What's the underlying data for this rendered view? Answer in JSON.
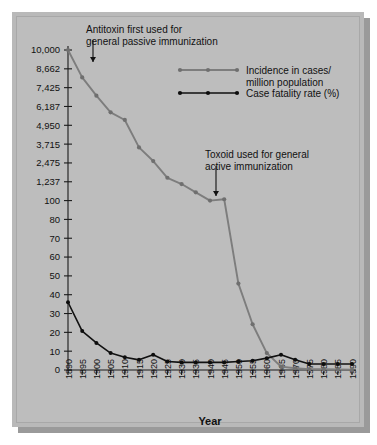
{
  "figure": {
    "background_color": "#ffffff",
    "panel_color": "#b9b9b9",
    "shadow_color": "#9a9a9a"
  },
  "colors": {
    "incidence": "#7d7d7d",
    "fatality": "#111111",
    "axis": "#1a1a1a",
    "text": "#111111"
  },
  "annotations": [
    {
      "name": "antitoxin-annotation",
      "line1": "Antitoxin first used for",
      "line2": "general passive immunization",
      "target_year": 1895
    },
    {
      "name": "toxoid-annotation",
      "line1": "Toxoid used for general",
      "line2": "active immunization",
      "target_year": 1940
    }
  ],
  "legend": {
    "position": "top-right",
    "entries": [
      {
        "name": "legend-incidence",
        "label_line1": "Incidence in cases/",
        "label_line2": "million population",
        "color": "#7d7d7d",
        "marker": "line-with-dots"
      },
      {
        "name": "legend-fatality",
        "label_line1": "Case fatality rate (%)",
        "label_line2": "",
        "color": "#111111",
        "marker": "line-with-dots"
      }
    ]
  },
  "chart_data": {
    "type": "line",
    "title": "",
    "subtitle": "",
    "xlabel": "Year",
    "ylabel": "",
    "grid": false,
    "legend_position": "top-right",
    "x": [
      1890,
      1895,
      1900,
      1905,
      1910,
      1915,
      1920,
      1925,
      1930,
      1935,
      1940,
      1945,
      1950,
      1955,
      1960,
      1965,
      1970,
      1975,
      1980,
      1985,
      1990
    ],
    "xlim": [
      1890,
      1990
    ],
    "xtick_labels": [
      "1890",
      "1895",
      "1900",
      "1905",
      "1910",
      "1915",
      "1920",
      "1925",
      "1930",
      "1935",
      "1940",
      "1945",
      "1950",
      "1955",
      "1960",
      "1965",
      "1970",
      "1975",
      "1980",
      "1985",
      "1990"
    ],
    "ytick_labels": [
      "0",
      "10",
      "20",
      "30",
      "40",
      "50",
      "60",
      "70",
      "80",
      "100",
      "1,237",
      "2,475",
      "3,715",
      "4,950",
      "6,187",
      "7,425",
      "8,662",
      "10,000"
    ],
    "ytick_values": [
      0,
      10,
      20,
      30,
      40,
      50,
      60,
      70,
      80,
      100,
      1237,
      2475,
      3715,
      4950,
      6187,
      7425,
      8662,
      10000
    ],
    "yaxis_note": "compressed scale: linear 0-100 below, expanded decade steps above 100",
    "series": [
      {
        "name": "Incidence in cases/million population",
        "color": "#7d7d7d",
        "values": [
          10000,
          8100,
          6900,
          5800,
          5300,
          3500,
          2600,
          1500,
          1100,
          600,
          100,
          180,
          51,
          27,
          10,
          2,
          1,
          0.5,
          0.4,
          0.3,
          0.2
        ]
      },
      {
        "name": "Case fatality rate (%)",
        "color": "#111111",
        "values": [
          40,
          23,
          16,
          10,
          7.5,
          6,
          9,
          5,
          4.5,
          4.5,
          4.5,
          4.5,
          5,
          5.5,
          7,
          9,
          6,
          3.5,
          3.5,
          3.5,
          3.5
        ]
      }
    ]
  }
}
